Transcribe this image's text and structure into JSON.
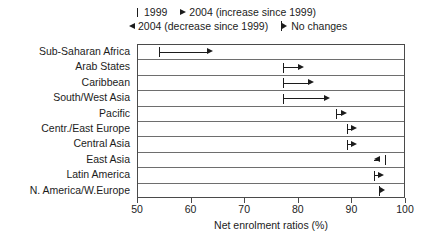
{
  "legend": {
    "rows": [
      {
        "items": [
          {
            "marker": "tick",
            "label": "1999"
          },
          {
            "marker": "arrow-right",
            "label": "2004 (increase since 1999)"
          }
        ]
      },
      {
        "items": [
          {
            "marker": "arrow-left",
            "label": "2004 (decrease since 1999)"
          },
          {
            "marker": "no-change",
            "label": "No changes"
          }
        ]
      }
    ]
  },
  "axis": {
    "ticks": [
      "50",
      "60",
      "70",
      "80",
      "90",
      "100"
    ],
    "title": "Net enrolment ratios (%)",
    "min": 50,
    "max": 100
  },
  "chart_data": {
    "type": "bar",
    "title": "",
    "subtitle": "",
    "xlabel": "Net enrolment ratios (%)",
    "ylabel": "",
    "xlim": [
      50,
      100
    ],
    "xticks": [
      50,
      60,
      70,
      80,
      90,
      100
    ],
    "grid": false,
    "legend_position": "top",
    "orientation": "horizontal",
    "categories": [
      "Sub-Saharan Africa",
      "Arab States",
      "Caribbean",
      "South/West Asia",
      "Pacific",
      "Centr./East Europe",
      "Central Asia",
      "East Asia",
      "Latin America",
      "N. America/W.Europe"
    ],
    "series": [
      {
        "name": "1999",
        "values": [
          54,
          77,
          77,
          77,
          87,
          89,
          89,
          96,
          94,
          95
        ]
      },
      {
        "name": "2004",
        "values": [
          64,
          81,
          83,
          86,
          89,
          91,
          91,
          94,
          96,
          95
        ]
      }
    ],
    "change": [
      "increase",
      "increase",
      "increase",
      "increase",
      "increase",
      "increase",
      "increase",
      "decrease",
      "increase",
      "no-change"
    ]
  }
}
